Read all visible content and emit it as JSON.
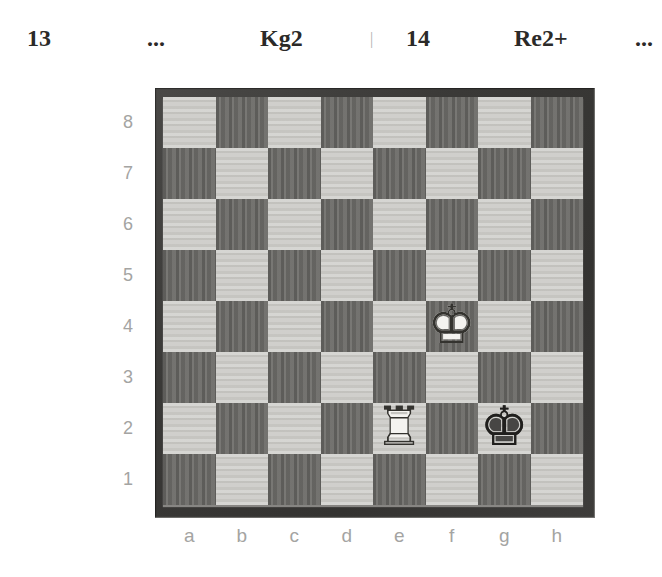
{
  "notation": {
    "move13_number": "13",
    "move13_white": "...",
    "move13_black": "Kg2",
    "separator": "|",
    "move14_number": "14",
    "move14_white": "Re2+",
    "move14_black": "..."
  },
  "board": {
    "rank_labels": [
      "8",
      "7",
      "6",
      "5",
      "4",
      "3",
      "2",
      "1"
    ],
    "file_labels": [
      "a",
      "b",
      "c",
      "d",
      "e",
      "f",
      "g",
      "h"
    ],
    "pieces": [
      {
        "square": "f4",
        "name": "white-king",
        "fill_glyph": "♚",
        "outline_glyph": "♔",
        "fill_color": "#f4f3f0",
        "outline_color": "#34332f"
      },
      {
        "square": "e2",
        "name": "white-rook",
        "fill_glyph": "♜",
        "outline_glyph": "♖",
        "fill_color": "#f4f3f0",
        "outline_color": "#34332f"
      },
      {
        "square": "g2",
        "name": "black-king",
        "fill_glyph": "♚",
        "outline_glyph": "♔",
        "fill_color": "#474644",
        "outline_color": "#201f1d"
      }
    ],
    "colors": {
      "light_square": "#cbcac6",
      "dark_square": "#6f6e6b",
      "frame": "#3a3937",
      "label_text": "#a4a4a2",
      "notation_text": "#2b2a28"
    }
  }
}
